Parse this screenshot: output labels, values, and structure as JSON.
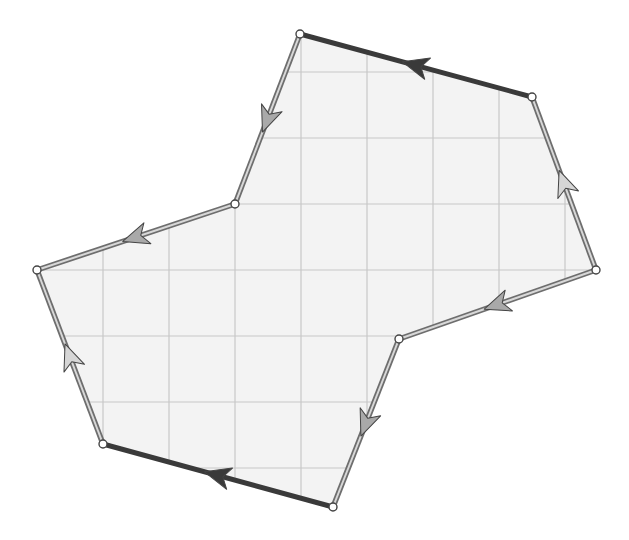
{
  "diagram": {
    "title": "",
    "width": 629,
    "height": 540,
    "colors": {
      "background": "#ffffff",
      "fill": "#f3f3f3",
      "grid": "#c8c8c8",
      "dark_edge": "#3a3a3a",
      "double_edge_outer": "#6e6e6e",
      "double_edge_inner": "#d8d8d8",
      "dark_arrow": "#3a3a3a",
      "light_arrow": "#a9a9a9",
      "light_arrow_pale": "#d6d6d6",
      "vertex_fill": "#ffffff",
      "vertex_stroke": "#444444"
    },
    "grid": {
      "vertical_x": [
        103,
        169,
        235,
        301,
        367,
        433,
        499,
        565
      ],
      "horizontal_y": [
        72,
        138,
        204,
        270,
        336,
        402,
        468
      ],
      "spacing": 66
    },
    "vertices": [
      {
        "id": "A",
        "x": 300,
        "y": 34
      },
      {
        "id": "B",
        "x": 532,
        "y": 97
      },
      {
        "id": "C",
        "x": 596,
        "y": 270
      },
      {
        "id": "D",
        "x": 399,
        "y": 339
      },
      {
        "id": "E",
        "x": 333,
        "y": 507
      },
      {
        "id": "F",
        "x": 103,
        "y": 444
      },
      {
        "id": "G",
        "x": 37,
        "y": 270
      },
      {
        "id": "H",
        "x": 235,
        "y": 204
      }
    ],
    "edges": [
      {
        "from": "B",
        "to": "A",
        "style": "dark",
        "arrow": "dark"
      },
      {
        "from": "A",
        "to": "H",
        "style": "double",
        "arrow": "gray"
      },
      {
        "from": "H",
        "to": "G",
        "style": "double",
        "arrow": "gray"
      },
      {
        "from": "F",
        "to": "G",
        "style": "double",
        "arrow": "pale"
      },
      {
        "from": "E",
        "to": "F",
        "style": "dark",
        "arrow": "dark"
      },
      {
        "from": "D",
        "to": "E",
        "style": "double",
        "arrow": "gray"
      },
      {
        "from": "C",
        "to": "D",
        "style": "double",
        "arrow": "gray"
      },
      {
        "from": "C",
        "to": "B",
        "style": "double",
        "arrow": "pale"
      }
    ]
  }
}
